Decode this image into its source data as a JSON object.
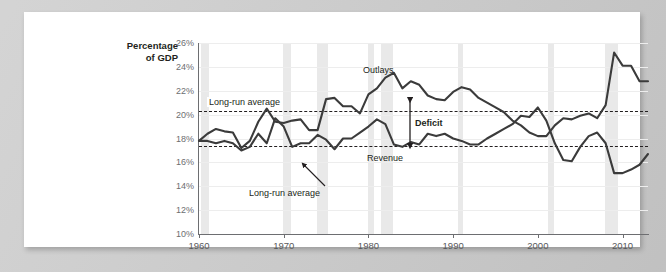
{
  "chart_data": {
    "type": "line",
    "title": "",
    "xlabel": "",
    "ylabel": "Percentage of GDP",
    "ylabel_line1": "Percentage",
    "ylabel_line2": "of GDP",
    "xlim": [
      1960,
      2013
    ],
    "ylim": [
      10,
      26
    ],
    "ytick_labels": [
      "26%",
      "24%",
      "22%",
      "20%",
      "18%",
      "16%",
      "14%",
      "12%",
      "10%"
    ],
    "ytick_values": [
      26,
      24,
      22,
      20,
      18,
      16,
      14,
      12,
      10
    ],
    "xtick_labels": [
      "1960",
      "1970",
      "1980",
      "1990",
      "2000",
      "2010"
    ],
    "xtick_values": [
      1960,
      1970,
      1980,
      1990,
      2000,
      2010
    ],
    "grid": true,
    "legend_position": "inline-annotations",
    "x": [
      1960,
      1961,
      1962,
      1963,
      1964,
      1965,
      1966,
      1967,
      1968,
      1969,
      1970,
      1971,
      1972,
      1973,
      1974,
      1975,
      1976,
      1977,
      1978,
      1979,
      1980,
      1981,
      1982,
      1983,
      1984,
      1985,
      1986,
      1987,
      1988,
      1989,
      1990,
      1991,
      1992,
      1993,
      1994,
      1995,
      1996,
      1997,
      1998,
      1999,
      2000,
      2001,
      2002,
      2003,
      2004,
      2005,
      2006,
      2007,
      2008,
      2009,
      2010,
      2011,
      2012,
      2013
    ],
    "series": [
      {
        "name": "Outlays",
        "color": "#3b3b3b",
        "values": [
          17.8,
          18.4,
          18.8,
          18.6,
          18.5,
          17.2,
          17.8,
          19.4,
          20.5,
          19.4,
          19.3,
          19.5,
          19.6,
          18.7,
          18.7,
          21.3,
          21.4,
          20.7,
          20.7,
          20.1,
          21.7,
          22.2,
          23.1,
          23.5,
          22.2,
          22.8,
          22.5,
          21.6,
          21.3,
          21.2,
          21.9,
          22.3,
          22.1,
          21.4,
          21.0,
          20.6,
          20.2,
          19.5,
          19.1,
          18.5,
          18.2,
          18.2,
          19.1,
          19.7,
          19.6,
          19.9,
          20.1,
          19.7,
          20.8,
          25.2,
          24.1,
          24.1,
          22.8,
          22.8
        ]
      },
      {
        "name": "Revenue",
        "color": "#3b3b3b",
        "values": [
          17.8,
          17.8,
          17.6,
          17.8,
          17.6,
          17.0,
          17.3,
          18.4,
          17.6,
          19.7,
          19.0,
          17.3,
          17.6,
          17.6,
          18.3,
          17.9,
          17.1,
          18.0,
          18.0,
          18.5,
          19.0,
          19.6,
          19.2,
          17.5,
          17.3,
          17.7,
          17.5,
          18.4,
          18.2,
          18.4,
          18.0,
          17.8,
          17.5,
          17.5,
          18.0,
          18.4,
          18.8,
          19.2,
          19.9,
          19.8,
          20.6,
          19.5,
          17.6,
          16.2,
          16.1,
          17.3,
          18.2,
          18.5,
          17.6,
          15.1,
          15.1,
          15.4,
          15.8,
          16.7
        ]
      }
    ],
    "reference_lines": [
      {
        "label": "Long-run average",
        "series": "Outlays",
        "value": 20.3
      },
      {
        "label": "Long-run average",
        "series": "Revenue",
        "value": 17.4
      }
    ],
    "recession_bands": [
      [
        1960.2,
        1961.2
      ],
      [
        1969.9,
        1970.9
      ],
      [
        1973.9,
        1975.2
      ],
      [
        1980.0,
        1980.6
      ],
      [
        1981.5,
        1982.9
      ],
      [
        1990.6,
        1991.2
      ],
      [
        2001.2,
        2001.9
      ],
      [
        2007.9,
        2009.5
      ]
    ],
    "annotations": [
      {
        "name": "outlays-label",
        "text": "Outlays",
        "bold": false
      },
      {
        "name": "revenue-label",
        "text": "Revenue",
        "bold": false
      },
      {
        "name": "deficit-label",
        "text": "Deficit",
        "bold": true
      },
      {
        "name": "outlays-average-label",
        "text": "Long-run average",
        "bold": false
      },
      {
        "name": "revenue-average-label",
        "text": "Long-run average",
        "bold": false
      }
    ]
  }
}
